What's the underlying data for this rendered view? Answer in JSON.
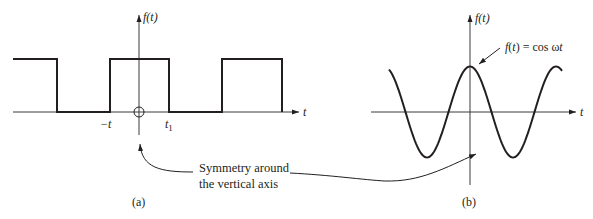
{
  "colors": {
    "stroke": "#231f20",
    "axis": "#3a3a3a",
    "background": "#ffffff"
  },
  "panel_a": {
    "caption": "(a)",
    "y_axis_label": "f(t)",
    "x_axis_label": "t",
    "tick_neg": "−t",
    "tick_pos": "t",
    "tick_pos_sub": "1",
    "signal": "square wave",
    "origin_marker": "circle-crosshair"
  },
  "panel_b": {
    "caption": "(b)",
    "y_axis_label": "f(t)",
    "x_axis_label": "t",
    "curve_label": "f(t) = cos ωt",
    "signal": "cosine"
  },
  "annotation": {
    "line1": "Symmetry around",
    "line2": "the vertical axis"
  }
}
